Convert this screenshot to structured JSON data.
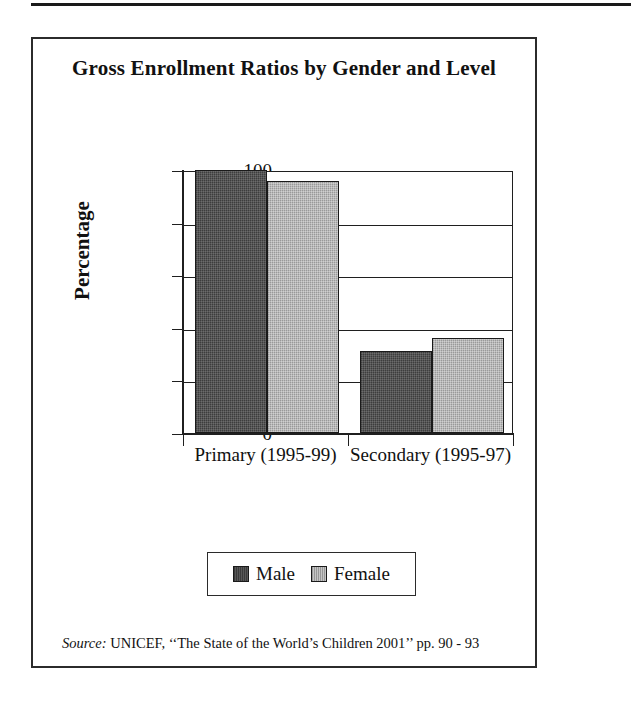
{
  "figure": {
    "title": "Gross Enrollment Ratios by Gender and Level",
    "source_lead": "Source:",
    "source_text": "UNICEF, ‘‘The State of the World’s Children 2001’’ pp. 90 - 93"
  },
  "colors": {
    "male": "#4a4a4a",
    "female": "#b2b2b2",
    "axis": "#1f1f1f",
    "frame": "#2b2b2b",
    "background": "#ffffff"
  },
  "chart_data": {
    "type": "bar",
    "title": "Gross Enrollment Ratios by Gender and Level",
    "xlabel": "",
    "ylabel": "Percentage",
    "categories": [
      "Primary (1995-99)",
      "Secondary (1995-97)"
    ],
    "series": [
      {
        "name": "Male",
        "values": [
          100,
          31
        ]
      },
      {
        "name": "Female",
        "values": [
          96,
          36
        ]
      }
    ],
    "ylim": [
      0,
      100
    ],
    "yticks": [
      0,
      20,
      40,
      60,
      80,
      100
    ],
    "ytick_labels": [
      "0",
      "20",
      "40",
      "60",
      "80",
      "100"
    ],
    "grid": true,
    "legend_position": "bottom",
    "legend_entries": [
      "Male",
      "Female"
    ]
  }
}
